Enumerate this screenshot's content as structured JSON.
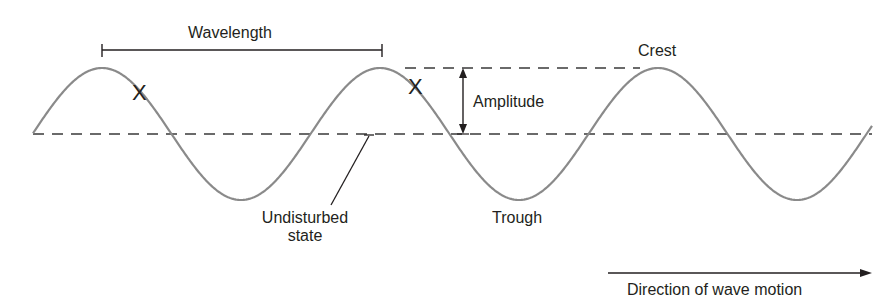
{
  "diagram": {
    "labels": {
      "wavelength": "Wavelength",
      "crest": "Crest",
      "amplitude": "Amplitude",
      "undisturbed": "Undisturbed",
      "undisturbed_line2": "state",
      "trough": "Trough",
      "direction": "Direction of wave motion",
      "marker": "X"
    },
    "colors": {
      "wave": "#8a8a8a",
      "ink": "#231f20",
      "dashes": "#3a3a3a",
      "background": "#ffffff"
    },
    "geometry": {
      "baseline_y": 134,
      "crest_y": 68,
      "trough_y": 200,
      "wave_start_x": 33,
      "wave_end_x": 872,
      "wavelength_px": 278,
      "crest_x": [
        102,
        380,
        658
      ],
      "trough_x": [
        241,
        520,
        798
      ]
    }
  }
}
